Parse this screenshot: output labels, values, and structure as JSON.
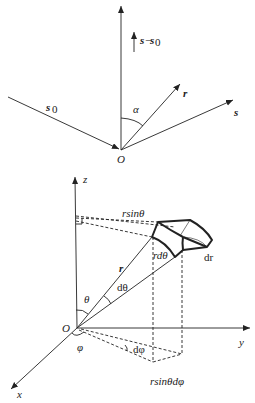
{
  "top_diagram": {
    "origin_label": "O",
    "incident_label": "s",
    "incident_sub": "0",
    "scattered_label": "s",
    "position_label": "r",
    "angle_label": "α",
    "difference_label_a": "s",
    "difference_sep": "−",
    "difference_label_b": "s",
    "difference_sub": "0"
  },
  "bottom_diagram": {
    "origin_label": "O",
    "z_label": "z",
    "y_label": "y",
    "x_label": "x",
    "r_label": "r",
    "theta_label": "θ",
    "dtheta_label": "dθ",
    "phi_label": "φ",
    "dphi_label": "dφ",
    "rsintheta_label": "rsinθ",
    "rdtheta_label": "rdθ",
    "dr_label": "dr",
    "rsinthetadphi_label": "rsinθdφ"
  },
  "colors": {
    "stroke": "#222222",
    "background": "#ffffff"
  }
}
